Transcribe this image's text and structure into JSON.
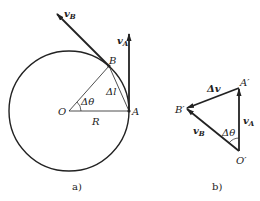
{
  "figure_a": {
    "caption": "a)",
    "labels": {
      "vB": "v",
      "vB_sub": "B",
      "vA": "v",
      "vA_sub": "A",
      "B": "B",
      "A": "A",
      "O": "O",
      "R": "R",
      "dtheta": "Δθ",
      "dl": "Δl"
    }
  },
  "figure_b": {
    "caption": "b)",
    "labels": {
      "dv": "Δv",
      "A_prime": "A′",
      "B_prime": "B′",
      "O_prime": "O′",
      "vA": "v",
      "vA_sub": "A",
      "vB": "v",
      "vB_sub": "B",
      "dtheta": "Δθ"
    }
  }
}
